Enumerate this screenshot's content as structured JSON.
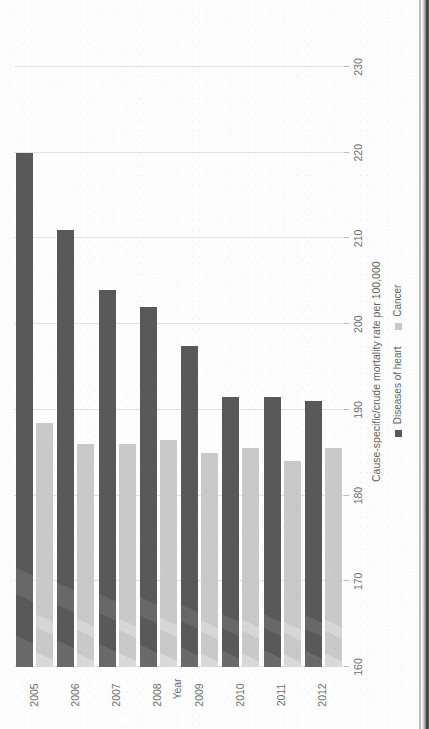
{
  "chart_data": {
    "type": "bar",
    "orientation": "horizontal",
    "title": "",
    "xlabel": "Year",
    "ylabel": "Cause-specific/crude mortality rate per 100,000",
    "categories": [
      "2005",
      "2006",
      "2007",
      "2008",
      "2009",
      "2010",
      "2011",
      "2012"
    ],
    "series": [
      {
        "name": "Diseases of heart",
        "color": "#595959",
        "values": [
          220.0,
          211.0,
          204.0,
          202.0,
          197.5,
          191.5,
          191.5,
          191.0
        ]
      },
      {
        "name": "Cancer",
        "color": "#c9c9c9",
        "values": [
          188.5,
          186.0,
          186.0,
          186.5,
          185.0,
          185.5,
          184.0,
          185.5
        ]
      }
    ],
    "ylim": [
      160,
      230
    ],
    "yticks": [
      160,
      170,
      180,
      190,
      200,
      210,
      220,
      230
    ],
    "grid": true,
    "legend_position": "bottom",
    "baseline": 160
  },
  "axis": {
    "x_title": "Year",
    "y_title": "Cause-specific/crude mortality rate per 100,000",
    "tick_labels": [
      "160",
      "170",
      "180",
      "190",
      "200",
      "210",
      "220",
      "230"
    ],
    "category_labels": [
      "2005",
      "2006",
      "2007",
      "2008",
      "2009",
      "2010",
      "2011",
      "2012"
    ]
  },
  "legend": {
    "items": [
      {
        "label": "Diseases of heart",
        "color": "#595959"
      },
      {
        "label": "Cancer",
        "color": "#c9c9c9"
      }
    ]
  }
}
